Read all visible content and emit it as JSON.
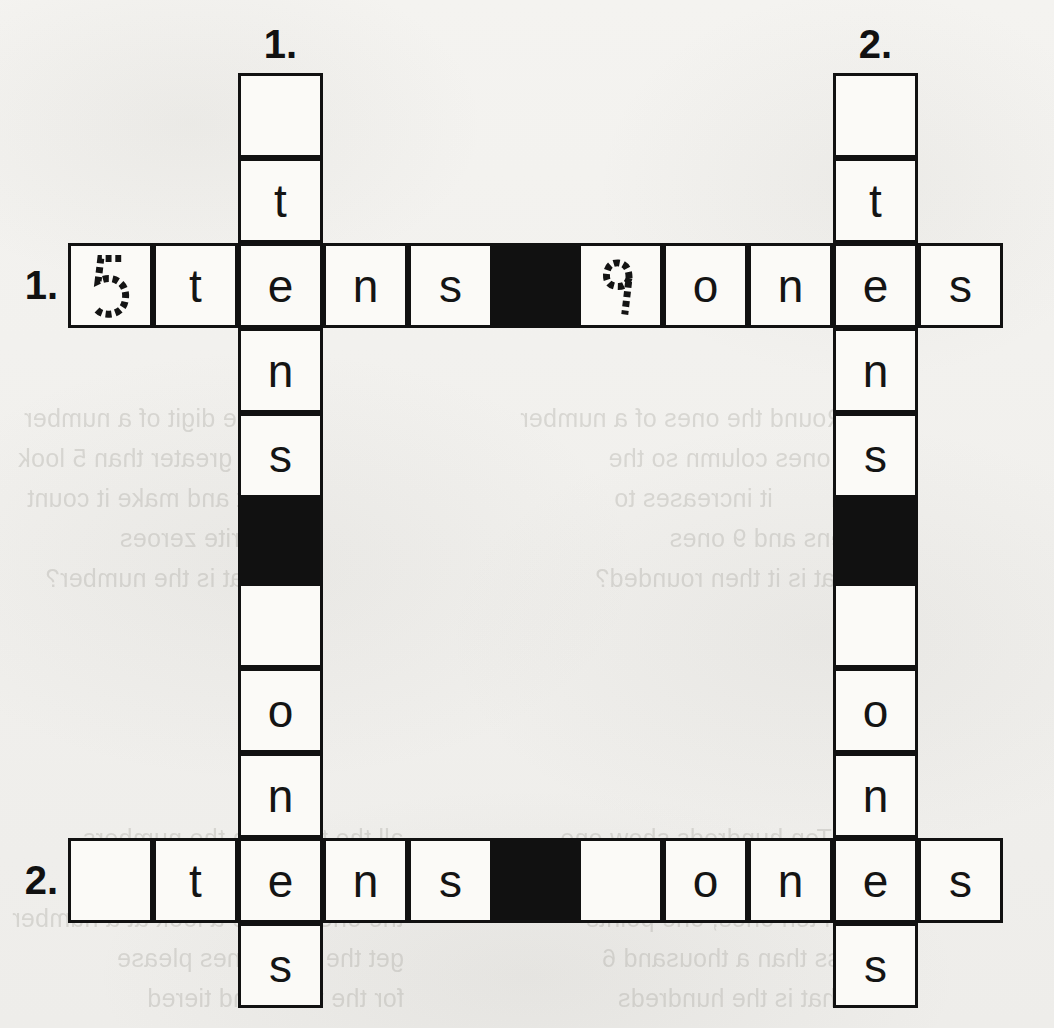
{
  "page": {
    "background_color": "#f2f1ee",
    "ink_color": "#111111",
    "cell_fill": "#fbfaf7",
    "block_fill": "#111111"
  },
  "grid": {
    "columns": 11,
    "rows": 11,
    "cell_size": 85,
    "origin_x": 68,
    "origin_y": 73,
    "down_columns": [
      2,
      9
    ],
    "across_rows": [
      2,
      9
    ]
  },
  "labels": {
    "down_1": "1.",
    "down_2": "2.",
    "across_1": "1.",
    "across_2": "2."
  },
  "entries": {
    "across_1": {
      "number": "1.",
      "row": 2,
      "cells": [
        "5",
        "t",
        "e",
        "n",
        "s",
        "",
        "9",
        "o",
        "n",
        "e",
        "s"
      ],
      "blocks": [
        5
      ],
      "traced": [
        0,
        6
      ],
      "answer": "5 tens 9 ones"
    },
    "across_2": {
      "number": "2.",
      "row": 9,
      "cells": [
        "",
        "t",
        "e",
        "n",
        "s",
        "",
        "",
        "o",
        "n",
        "e",
        "s"
      ],
      "blocks": [
        5
      ],
      "traced": [],
      "answer": "tens ones"
    },
    "down_1": {
      "number": "1.",
      "column": 2,
      "cells": [
        "",
        "t",
        "e",
        "n",
        "s",
        "",
        "",
        "o",
        "n",
        "e",
        "s"
      ],
      "blocks": [
        5
      ],
      "answer": "tens ones"
    },
    "down_2": {
      "number": "2.",
      "column": 9,
      "cells": [
        "",
        "t",
        "e",
        "n",
        "s",
        "",
        "",
        "o",
        "n",
        "e",
        "s"
      ],
      "blocks": [
        5
      ],
      "answer": "tens ones"
    }
  },
  "ghost_text": {
    "left_block": "the digit of a number\nis greater than 5 look\nat and make it count\nwrite zeroes\nhat is the number?",
    "right_block": "2. Round the ones of a number\nthe ones column so the\nand        it increases to\n6 tens and 9 ones\nWhat is it then rounded?",
    "bottom_left": "all the things in the numbers\nplace is always the one\nthe ones. Have a look at a number\nget the if ten ones please\nfor the thousand tiered",
    "bottom_right": "1. Ten hundreds show one\nThey each go to one tens\nten ten ones, one points\nless than a thousand 6\nWhat is the hundreds"
  }
}
